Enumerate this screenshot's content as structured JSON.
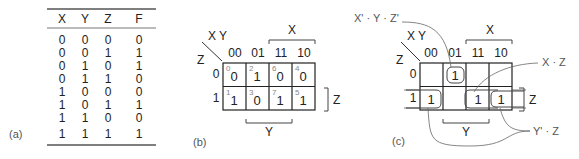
{
  "panel_a": {
    "caption": "(a)",
    "columns": [
      "X",
      "Y",
      "Z",
      "F"
    ],
    "rows": [
      [
        "0",
        "0",
        "0",
        "0"
      ],
      [
        "0",
        "0",
        "1",
        "1"
      ],
      [
        "0",
        "1",
        "0",
        "1"
      ],
      [
        "0",
        "1",
        "1",
        "0"
      ],
      [
        "1",
        "0",
        "0",
        "0"
      ],
      [
        "1",
        "0",
        "1",
        "1"
      ],
      [
        "1",
        "1",
        "0",
        "0"
      ],
      [
        "1",
        "1",
        "1",
        "1"
      ]
    ]
  },
  "panel_b": {
    "caption": "(b)",
    "corner_top": "X Y",
    "corner_left": "Z",
    "col_headers": [
      "00",
      "01",
      "11",
      "10"
    ],
    "row_headers": [
      "0",
      "1"
    ],
    "bracket_x": "X",
    "bracket_y": "Y",
    "bracket_z": "Z",
    "cells": [
      [
        {
          "idx": "0",
          "val": "0"
        },
        {
          "idx": "2",
          "val": "1"
        },
        {
          "idx": "6",
          "val": "0"
        },
        {
          "idx": "4",
          "val": "0"
        }
      ],
      [
        {
          "idx": "1",
          "val": "1"
        },
        {
          "idx": "3",
          "val": "0"
        },
        {
          "idx": "7",
          "val": "1"
        },
        {
          "idx": "5",
          "val": "1"
        }
      ]
    ]
  },
  "panel_c": {
    "caption": "(c)",
    "corner_top": "X Y",
    "corner_left": "Z",
    "col_headers": [
      "00",
      "01",
      "11",
      "10"
    ],
    "row_headers": [
      "0",
      "1"
    ],
    "bracket_x": "X",
    "bracket_y": "Y",
    "bracket_z": "Z",
    "cells": [
      [
        "",
        "1",
        "",
        ""
      ],
      [
        "1",
        "",
        "1",
        "1"
      ]
    ],
    "annotations": {
      "term1": "X' · Y · Z'",
      "term2": "X · Z",
      "term3": "Y' · Z"
    }
  }
}
